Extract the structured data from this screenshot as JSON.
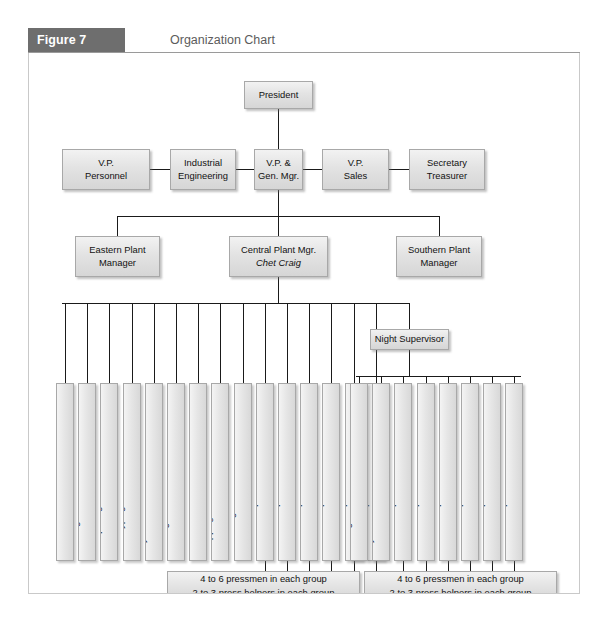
{
  "figure": {
    "tag": "Figure 7",
    "title": "Organization Chart"
  },
  "chart_data": {
    "type": "diagram",
    "diagram_type": "organization-chart",
    "title": "Organization Chart",
    "levels": [
      {
        "level": 1,
        "nodes": [
          {
            "label": "President"
          }
        ]
      },
      {
        "level": 2,
        "nodes": [
          {
            "label": "V.P. Personnel"
          },
          {
            "label": "Industrial Engineering"
          },
          {
            "label": "V.P. & Gen. Mgr."
          },
          {
            "label": "V.P. Sales"
          },
          {
            "label": "Secretary Treasurer"
          }
        ]
      },
      {
        "level": 3,
        "nodes": [
          {
            "label": "Eastern Plant Manager"
          },
          {
            "label": "Central Plant Mgr.",
            "person": "Chet Craig"
          },
          {
            "label": "Southern Plant Manager"
          }
        ]
      },
      {
        "level": 4,
        "nodes": [
          {
            "label": "Night Supervisor"
          }
        ]
      }
    ]
  },
  "nodes": {
    "president": {
      "line1": "President"
    },
    "vp_personnel": {
      "line1": "V.P.",
      "line2": "Personnel"
    },
    "industrial_engineering": {
      "line1": "Industrial",
      "line2": "Engineering"
    },
    "vp_gen_mgr": {
      "line1": "V.P. &",
      "line2": "Gen. Mgr."
    },
    "vp_sales": {
      "line1": "V.P.",
      "line2": "Sales"
    },
    "secretary_treasurer": {
      "line1": "Secretary",
      "line2": "Treasurer"
    },
    "eastern_plant": {
      "line1": "Eastern Plant",
      "line2": "Manager"
    },
    "central_plant": {
      "line1": "Central Plant Mgr.",
      "line2": "Chet Craig"
    },
    "southern_plant": {
      "line1": "Southern Plant",
      "line2": "Manager"
    },
    "night_supervisor": {
      "line1": "Night Supervisor"
    }
  },
  "central_reports": [
    {
      "line1": "Office Manager",
      "line2": "(Marilyn)"
    },
    {
      "line1": "Routing Foreman"
    },
    {
      "line1": "Composing Room Foreman"
    },
    {
      "line1": "Sterotyping Foreman"
    },
    {
      "line1": "Layout Foreman"
    },
    {
      "line1": "Folding-Room Foreman"
    },
    {
      "line1": "Stockroom Foreman",
      "line2": "(Al Noren)"
    },
    {
      "line1": "Shipping Room Foreman"
    },
    {
      "line1": "Receiving Room Foreman"
    },
    {
      "line1": "Press Group I Foreman"
    },
    {
      "line1": "Press Group II Foreman"
    },
    {
      "line1": "Press Group III Foreman"
    },
    {
      "line1": "Press Group IV Foreman"
    },
    {
      "line1": "Press Group V Foreman"
    },
    {
      "line1": "Press Group VI Foreman"
    }
  ],
  "night_reports": [
    {
      "line1": "Folding Room Foreman"
    },
    {
      "line1": "Layout Foreman"
    },
    {
      "line1": "Press Group I Foreman"
    },
    {
      "line1": "Press Group II Foreman"
    },
    {
      "line1": "Press Group III Foreman"
    },
    {
      "line1": "Press Group IV Foreman"
    },
    {
      "line1": "Press Group V Foreman"
    },
    {
      "line1": "Press Group VI Foreman"
    }
  ],
  "notes": {
    "left": {
      "line1": "4 to 6 pressmen in each group",
      "line2": "2 to 3 press helpers in each group"
    },
    "right": {
      "line1": "4 to 6 pressmen in each group",
      "line2": "2 to 3 press helpers in each group"
    }
  },
  "colors": {
    "tag_background": "#6e6e6e",
    "tag_text": "#ffffff",
    "title_text": "#5c5c5c",
    "box_fill": "#e3e3e3",
    "box_border": "#a8a8a8",
    "line": "#1a1a1a",
    "frame_border": "#c9c9c9"
  }
}
